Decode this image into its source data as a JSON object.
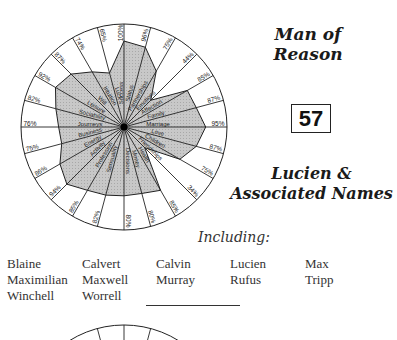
{
  "header": {
    "title_line1": "Man of",
    "title_line2": "Reason",
    "number": "57",
    "subtitle_line1": "Lucien &",
    "subtitle_line2": "Associated Names",
    "including_label": "Including:"
  },
  "names": [
    [
      "Blaine",
      "Calvert",
      "Calvin",
      "Lucien",
      "Max"
    ],
    [
      "Maximilian",
      "Maxwell",
      "Murray",
      "Rufus",
      "Tripp"
    ],
    [
      "Winchell",
      "Worrell"
    ]
  ],
  "chart_data": {
    "type": "radar",
    "title": "Man of Reason",
    "categories": [
      "Success",
      "Status",
      "Partnerships",
      "Emotions",
      "Affection",
      "Family",
      "Marriage",
      "Love",
      "Children",
      "Friendships",
      "Health",
      "Money",
      "Decisions",
      "Sensuality",
      "Profession",
      "Activity",
      "Energy",
      "Business",
      "Journeys",
      "Sociability",
      "Leisure",
      "Will",
      "Intuition",
      "Luck"
    ],
    "values": [
      100,
      96,
      75,
      44,
      85,
      87,
      95,
      87,
      75,
      34,
      85,
      80,
      80,
      82,
      85,
      94,
      86,
      75,
      76,
      82,
      92,
      87,
      74,
      65
    ],
    "value_labels": [
      "100%",
      "96%",
      "75%",
      "44%",
      "85%",
      "87%",
      "95%",
      "87%",
      "75%",
      "34%",
      "85%",
      "80%",
      "80%",
      "82%",
      "85%",
      "94%",
      "86%",
      "75%",
      "76%",
      "82%",
      "92%",
      "87%",
      "74%",
      "65%"
    ],
    "rlim": [
      0,
      100
    ],
    "start_angle_deg": 0,
    "direction": "clockwise",
    "fill_color": "#c8c8c8",
    "line_color": "#222222"
  }
}
